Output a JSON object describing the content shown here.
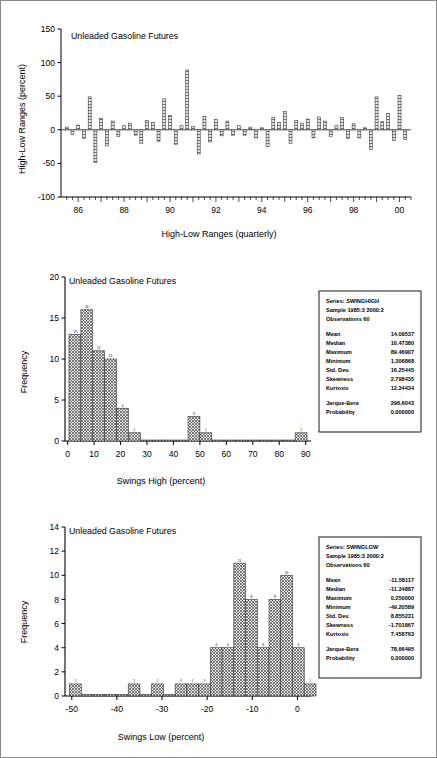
{
  "document": {
    "title": "Unleaded Gasoline Futures charts",
    "background": "#ffffff",
    "border_color": "#8a8a8a"
  },
  "chart_data": [
    {
      "id": "high-low-ranges",
      "type": "bar",
      "title": "Unleaded Gasoline Futures",
      "xlabel": "High-Low Ranges (quarterly)",
      "ylabel": "High-Low Ranges (percent)",
      "ylim": [
        -100,
        150
      ],
      "ytick_labels": [
        "150",
        "100",
        "50",
        "0",
        "-50",
        "-100"
      ],
      "yticks": [
        150,
        100,
        50,
        0,
        -50,
        -100
      ],
      "xtick_labels": [
        "86",
        "88",
        "90",
        "92",
        "94",
        "96",
        "98",
        "00"
      ],
      "xticks": [
        1986,
        1988,
        1990,
        1992,
        1994,
        1996,
        1998,
        2000
      ],
      "xlim": [
        1985.25,
        2000.5
      ],
      "grid": false,
      "bar_fill": "#d9d9d9",
      "bar_stroke": "#333333",
      "x": [
        1985.5,
        1985.75,
        1986.0,
        1986.25,
        1986.5,
        1986.75,
        1987.0,
        1987.25,
        1987.5,
        1987.75,
        1988.0,
        1988.25,
        1988.5,
        1988.75,
        1989.0,
        1989.25,
        1989.5,
        1989.75,
        1990.0,
        1990.25,
        1990.5,
        1990.75,
        1991.0,
        1991.25,
        1991.5,
        1991.75,
        1992.0,
        1992.25,
        1992.5,
        1992.75,
        1993.0,
        1993.25,
        1993.5,
        1993.75,
        1994.0,
        1994.25,
        1994.5,
        1994.75,
        1995.0,
        1995.25,
        1995.5,
        1995.75,
        1996.0,
        1996.25,
        1996.5,
        1996.75,
        1997.0,
        1997.25,
        1997.5,
        1997.75,
        1998.0,
        1998.25,
        1998.5,
        1998.75,
        1999.0,
        1999.25,
        1999.5,
        1999.75,
        2000.0,
        2000.25
      ],
      "values": [
        4,
        -7,
        7,
        -13,
        49,
        -49,
        17,
        -24,
        13,
        -10,
        6,
        10,
        -8,
        -20,
        14,
        11,
        -17,
        46,
        21,
        -22,
        6,
        89,
        5,
        -36,
        20,
        -18,
        15,
        -9,
        13,
        -8,
        6,
        -8,
        4,
        -12,
        3,
        -25,
        18,
        11,
        27,
        -20,
        14,
        10,
        16,
        -12,
        19,
        13,
        -10,
        6,
        18,
        -13,
        9,
        -12,
        3,
        -29,
        49,
        12,
        24,
        -16,
        51,
        -14
      ]
    },
    {
      "id": "swings-high-histogram",
      "type": "bar",
      "title": "Unleaded Gasoline Futures",
      "xlabel": "Swings High (percent)",
      "ylabel": "Frequency",
      "ylim": [
        0,
        20
      ],
      "ytick_labels": [
        "20",
        "15",
        "10",
        "5",
        "0"
      ],
      "yticks": [
        20,
        15,
        10,
        5,
        0
      ],
      "xtick_labels": [
        "0",
        "10",
        "20",
        "30",
        "40",
        "50",
        "60",
        "70",
        "80",
        "90"
      ],
      "xticks": [
        0,
        10,
        20,
        30,
        40,
        50,
        60,
        70,
        80,
        90
      ],
      "xlim": [
        -1,
        92
      ],
      "bin_width": 4.5,
      "bin_starts": [
        0.5,
        5.0,
        9.5,
        14.0,
        18.5,
        23.0,
        27.5,
        32.0,
        36.5,
        41.0,
        45.5,
        50.0,
        54.5,
        59.0,
        63.5,
        68.0,
        72.5,
        77.0,
        81.5,
        86.0
      ],
      "values": [
        13,
        16,
        11,
        10,
        4,
        1,
        0,
        0,
        0,
        0,
        3,
        1,
        0,
        0,
        0,
        0,
        0,
        0,
        0,
        1
      ],
      "bar_fill": "#cfcfcf",
      "bar_stroke": "#333333",
      "stats": {
        "series_line": "Series: SWINGHIGH",
        "sample_line": "Sample 1985:3 2000:2",
        "observations_line": "Observations 60",
        "rows": [
          {
            "label": "Mean",
            "value": "14.09537"
          },
          {
            "label": "Median",
            "value": "10.47380"
          },
          {
            "label": "Maximum",
            "value": "89.46907"
          },
          {
            "label": "Minimum",
            "value": "1.306868"
          },
          {
            "label": "Std. Dev.",
            "value": "16.25445"
          },
          {
            "label": "Skewness",
            "value": "2.798435"
          },
          {
            "label": "Kurtosis",
            "value": "12.34434"
          }
        ],
        "tests": [
          {
            "label": "Jarque-Bera",
            "value": "296.6043"
          },
          {
            "label": "Probability",
            "value": "0.000000"
          }
        ]
      }
    },
    {
      "id": "swings-low-histogram",
      "type": "bar",
      "title": "Unleaded Gasoline Futures",
      "xlabel": "Swings Low (percent)",
      "ylabel": "Frequency",
      "ylim": [
        0,
        14
      ],
      "ytick_labels": [
        "14",
        "12",
        "10",
        "8",
        "6",
        "4",
        "2",
        "0"
      ],
      "yticks": [
        14,
        12,
        10,
        8,
        6,
        4,
        2,
        0
      ],
      "xtick_labels": [
        "-50",
        "-40",
        "-30",
        "-20",
        "-10",
        "0"
      ],
      "xticks": [
        -50,
        -40,
        -30,
        -20,
        -10,
        0
      ],
      "xlim": [
        -51.5,
        3.0
      ],
      "bin_width": 2.6,
      "bin_starts": [
        -50.5,
        -47.9,
        -45.3,
        -42.7,
        -40.1,
        -37.5,
        -34.9,
        -32.3,
        -29.7,
        -27.1,
        -24.5,
        -21.9,
        -19.3,
        -16.7,
        -14.1,
        -11.5,
        -8.9,
        -6.3,
        -3.7,
        -1.1
      ],
      "values": [
        1,
        0,
        0,
        0,
        0,
        1,
        0,
        1,
        0,
        1,
        1,
        1,
        4,
        4,
        11,
        8,
        4,
        8,
        10,
        4
      ],
      "extra_bin": {
        "start": 1.5,
        "value": 1
      },
      "bar_fill": "#cfcfcf",
      "bar_stroke": "#333333",
      "stats": {
        "series_line": "Series: SWINGLOW",
        "sample_line": "Sample 1985:3 2000:2",
        "observations_line": "Observations 60",
        "rows": [
          {
            "label": "Mean",
            "value": "-11.58117"
          },
          {
            "label": "Median",
            "value": "-11.34887"
          },
          {
            "label": "Maximum",
            "value": "0.250000"
          },
          {
            "label": "Minimum",
            "value": "-49.20589"
          },
          {
            "label": "Std. Dev.",
            "value": "8.855231"
          },
          {
            "label": "Skewness",
            "value": "-1.701867"
          },
          {
            "label": "Kurtosis",
            "value": "7.458763"
          }
        ],
        "tests": [
          {
            "label": "Jarque-Bera",
            "value": "78.66495"
          },
          {
            "label": "Probability",
            "value": "0.000000"
          }
        ]
      }
    }
  ]
}
